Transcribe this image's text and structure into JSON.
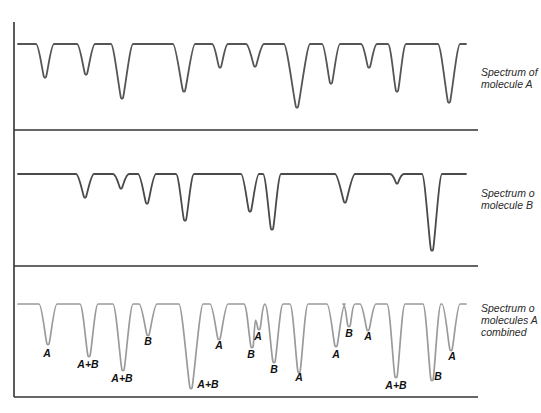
{
  "figure": {
    "colors": {
      "axis": "#333333",
      "trace_a": "#555555",
      "trace_b": "#4a4a4a",
      "trace_combined": "#9a9a9a",
      "label": "#111111",
      "caption": "#2a2a2a"
    },
    "panels": [
      {
        "id": "molecule-a",
        "caption_line1": "Spectrum of",
        "caption_line2": "molecule A",
        "caption_line3": "",
        "baseline_y": 44,
        "peaks": [
          {
            "x": 45,
            "y": 77,
            "w": 7
          },
          {
            "x": 86,
            "y": 74,
            "w": 7
          },
          {
            "x": 122,
            "y": 98,
            "w": 9
          },
          {
            "x": 184,
            "y": 91,
            "w": 9
          },
          {
            "x": 220,
            "y": 67,
            "w": 6
          },
          {
            "x": 255,
            "y": 66,
            "w": 7
          },
          {
            "x": 297,
            "y": 107,
            "w": 11
          },
          {
            "x": 331,
            "y": 83,
            "w": 7
          },
          {
            "x": 369,
            "y": 67,
            "w": 6
          },
          {
            "x": 397,
            "y": 91,
            "w": 7
          },
          {
            "x": 449,
            "y": 102,
            "w": 9
          }
        ]
      },
      {
        "id": "molecule-b",
        "caption_line1": "Spectrum o",
        "caption_line2": "molecule B",
        "caption_line3": "",
        "baseline_y": 174,
        "peaks": [
          {
            "x": 85,
            "y": 197,
            "w": 7
          },
          {
            "x": 121,
            "y": 188,
            "w": 6
          },
          {
            "x": 147,
            "y": 203,
            "w": 7
          },
          {
            "x": 185,
            "y": 220,
            "w": 7
          },
          {
            "x": 250,
            "y": 211,
            "w": 7
          },
          {
            "x": 272,
            "y": 229,
            "w": 7
          },
          {
            "x": 345,
            "y": 202,
            "w": 8
          },
          {
            "x": 397,
            "y": 183,
            "w": 5
          },
          {
            "x": 432,
            "y": 250,
            "w": 8
          }
        ]
      },
      {
        "id": "combined",
        "caption_line1": "Spectrum o",
        "caption_line2": "molecules A",
        "caption_line3": "combined",
        "baseline_y": 304,
        "peaks": [
          {
            "x": 48,
            "y": 344,
            "w": 7,
            "label": "A",
            "lx": 47,
            "ly": 357
          },
          {
            "x": 89,
            "y": 356,
            "w": 7,
            "label": "A+B",
            "lx": 88,
            "ly": 368
          },
          {
            "x": 123,
            "y": 370,
            "w": 8,
            "label": "A+B",
            "lx": 122,
            "ly": 382
          },
          {
            "x": 148,
            "y": 335,
            "w": 7,
            "label": "B",
            "lx": 148,
            "ly": 345
          },
          {
            "x": 191,
            "y": 388,
            "w": 10,
            "label": "A+B",
            "lx": 208,
            "ly": 388
          },
          {
            "x": 219,
            "y": 339,
            "w": 7,
            "label": "A",
            "lx": 219,
            "ly": 349
          },
          {
            "x": 252,
            "y": 347,
            "w": 6,
            "label": "B",
            "lx": 251,
            "ly": 358
          },
          {
            "x": 259,
            "y": 329,
            "w": 4,
            "label": "A",
            "lx": 258,
            "ly": 340
          },
          {
            "x": 274,
            "y": 362,
            "w": 7,
            "label": "B",
            "lx": 274,
            "ly": 373
          },
          {
            "x": 299,
            "y": 372,
            "w": 7,
            "label": "A",
            "lx": 299,
            "ly": 381
          },
          {
            "x": 336,
            "y": 346,
            "w": 7,
            "label": "A",
            "lx": 336,
            "ly": 358
          },
          {
            "x": 349,
            "y": 326,
            "w": 4,
            "label": "B",
            "lx": 349,
            "ly": 337
          },
          {
            "x": 368,
            "y": 330,
            "w": 6,
            "label": "A",
            "lx": 368,
            "ly": 340
          },
          {
            "x": 396,
            "y": 377,
            "w": 7,
            "label": "A+B",
            "lx": 396,
            "ly": 389
          },
          {
            "x": 432,
            "y": 380,
            "w": 7,
            "label": "B",
            "lx": 438,
            "ly": 380
          },
          {
            "x": 451,
            "y": 350,
            "w": 7,
            "label": "A",
            "lx": 452,
            "ly": 360
          }
        ]
      }
    ],
    "frame": {
      "axis_x": 14,
      "top_y": 22,
      "right_x": 478,
      "dividers_y": [
        130,
        266,
        397
      ],
      "trace_start_x": 18,
      "trace_end_x": 466
    }
  }
}
